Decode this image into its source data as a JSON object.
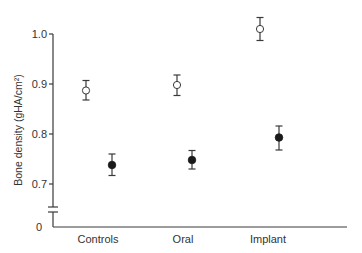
{
  "chart_data": {
    "type": "scatter",
    "title": "",
    "xlabel": "",
    "ylabel": "Bone density (gHA/cm²)",
    "categories": [
      "Controls",
      "Oral",
      "Implant"
    ],
    "ylim": [
      0.65,
      1.0
    ],
    "y_axis_break": true,
    "y_ticks": [
      {
        "value": 1.0,
        "label": "1.0"
      },
      {
        "value": 0.9,
        "label": "0.9"
      },
      {
        "value": 0.8,
        "label": "0.8"
      },
      {
        "value": 0.7,
        "label": "0.7"
      }
    ],
    "y_zero_label": "0",
    "grid": false,
    "legend": null,
    "series": [
      {
        "name": "open circles",
        "marker": "open-circle",
        "values": [
          0.887,
          0.898,
          1.01
        ],
        "error_upper": [
          0.907,
          0.918,
          1.033
        ],
        "error_lower": [
          0.868,
          0.877,
          0.987
        ]
      },
      {
        "name": "filled circles",
        "marker": "filled-circle",
        "values": [
          0.738,
          0.748,
          0.793
        ],
        "error_upper": [
          0.76,
          0.767,
          0.816
        ],
        "error_lower": [
          0.717,
          0.73,
          0.768
        ]
      }
    ]
  },
  "layout": {
    "y_axis_x": 53,
    "x_axis_y": 227,
    "x_axis_end": 347,
    "y_for_1_0": 34,
    "px_per_unit": 500,
    "break_y": [
      207,
      212
    ],
    "category_label_x": [
      98,
      183,
      268
    ],
    "series_x": [
      [
        86,
        177,
        260
      ],
      [
        112,
        192,
        279
      ]
    ]
  }
}
